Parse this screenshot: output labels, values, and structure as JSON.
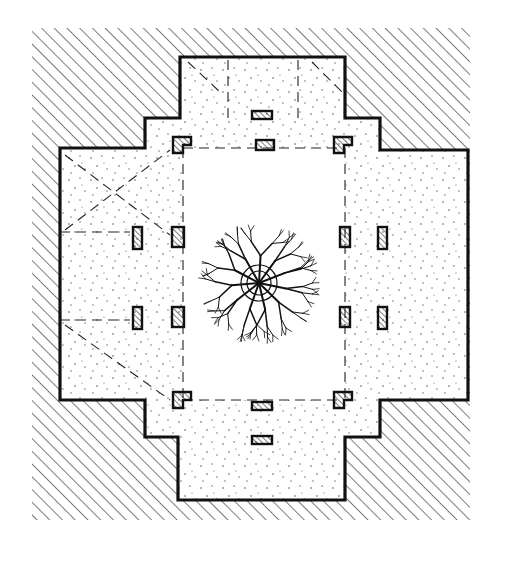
{
  "figure": {
    "type": "architectural-floor-plan",
    "style": "hand-drawn ink",
    "width": 521,
    "height": 565,
    "colors": {
      "background": "#ffffff",
      "ink": "#111111",
      "hatch": "#222222",
      "stipple": "#555555"
    },
    "site": {
      "label": "surrounding-ground-hatched",
      "bounds": [
        32,
        28,
        470,
        520
      ]
    },
    "building_outline": [
      [
        180,
        57
      ],
      [
        345,
        57
      ],
      [
        345,
        118
      ],
      [
        380,
        118
      ],
      [
        380,
        150
      ],
      [
        468,
        150
      ],
      [
        468,
        400
      ],
      [
        380,
        400
      ],
      [
        380,
        437
      ],
      [
        345,
        437
      ],
      [
        345,
        500
      ],
      [
        178,
        500
      ],
      [
        178,
        437
      ],
      [
        145,
        437
      ],
      [
        145,
        400
      ],
      [
        60,
        400
      ],
      [
        60,
        148
      ],
      [
        145,
        148
      ],
      [
        145,
        118
      ],
      [
        180,
        118
      ]
    ],
    "courtyard": {
      "label": "central-open-court",
      "rect": [
        183,
        148,
        345,
        400
      ]
    },
    "columns": [
      [
        133,
        227,
        9,
        22
      ],
      [
        172,
        227,
        12,
        20
      ],
      [
        340,
        227,
        10,
        20
      ],
      [
        378,
        227,
        9,
        22
      ],
      [
        133,
        307,
        9,
        22
      ],
      [
        172,
        307,
        12,
        20
      ],
      [
        340,
        307,
        10,
        20
      ],
      [
        378,
        307,
        9,
        22
      ],
      [
        252,
        111,
        20,
        8
      ],
      [
        256,
        140,
        18,
        10
      ],
      [
        252,
        402,
        20,
        8
      ],
      [
        252,
        436,
        20,
        8
      ]
    ],
    "corner_piers": [
      [
        173,
        137
      ],
      [
        334,
        137
      ],
      [
        173,
        392
      ],
      [
        334,
        392
      ]
    ],
    "tree": {
      "label": "central-tree",
      "cx": 259,
      "cy": 283,
      "canopy_r": 65,
      "trunk_rings": [
        18,
        12
      ]
    }
  }
}
